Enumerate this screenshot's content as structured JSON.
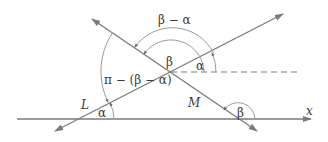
{
  "diagram": {
    "colors": {
      "line": "#7a7a7a",
      "arc": "#9a9a9a",
      "text": "#3a3a3a",
      "background": "#ffffff"
    },
    "labels": {
      "beta_minus_alpha": "β − α",
      "beta_center": "β",
      "alpha_center": "α",
      "pi_minus": "π − (β − α)",
      "line_L": "L",
      "line_M": "M",
      "alpha_bottom": "α",
      "beta_bottom": "β",
      "x_axis": "x"
    },
    "elements": {
      "x_axis": "horizontal x-axis with arrow to the right",
      "line_L": "line L rising left-to-right, arrows at both ends",
      "line_M": "line M falling left-to-right, arrows at both ends",
      "dashed_line": "horizontal dashed reference line through intersection",
      "arcs": [
        "arc for β − α between L and M (outer, top)",
        "arc for β from dashed line to M",
        "arc for α from dashed line to L",
        "arc for π − (β − α) on left side",
        "arc for α at L/x-axis intersection",
        "arc for β at M/x-axis intersection"
      ]
    }
  }
}
